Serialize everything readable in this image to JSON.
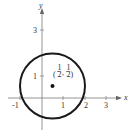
{
  "figure": {
    "axes": {
      "x_label": "x",
      "y_label": "y",
      "x_ticks": [
        "-1",
        "1",
        "2",
        "3"
      ],
      "y_ticks": [
        "1",
        "3"
      ]
    },
    "circle": {
      "center": [
        0.5,
        0.5
      ],
      "radius": 1.5811,
      "stroke_color": "#1a1a1a"
    },
    "point": {
      "label_open": "(",
      "num_x": "1",
      "den_x": "2",
      "comma": ",",
      "num_y": "1",
      "den_y": "2",
      "label_close": ")"
    },
    "colors": {
      "axis": "#888888",
      "text": "#333333",
      "circle": "#1a1a1a",
      "point": "#111111"
    }
  }
}
